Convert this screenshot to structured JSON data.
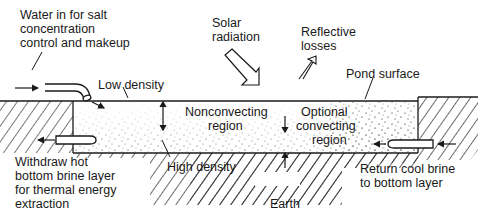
{
  "diagram": {
    "colors": {
      "ink": "#1a1a1a",
      "background": "#ffffff"
    },
    "labels": {
      "water_in": [
        "Water in for salt",
        "concentration",
        "control and makeup"
      ],
      "solar_radiation": [
        "Solar",
        "radiation"
      ],
      "reflective_losses": [
        "Reflective",
        "losses"
      ],
      "pond_surface": "Pond surface",
      "low_density": "Low density",
      "nonconvecting_region": [
        "Nonconvecting",
        "region"
      ],
      "optional_convecting_region": [
        "Optional",
        "convecting",
        "region"
      ],
      "high_density": "High density",
      "earth": "Earth",
      "withdraw_hot": [
        "Withdraw hot",
        "bottom brine layer",
        "for thermal energy",
        "extraction"
      ],
      "return_cool": [
        "Return cool brine",
        "to bottom layer"
      ]
    }
  }
}
